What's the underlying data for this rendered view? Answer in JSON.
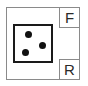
{
  "diagram": {
    "outer_frame": {
      "border_color": "#8a8a8a"
    },
    "labels": [
      {
        "id": "front",
        "text": "F",
        "position": "top-right"
      },
      {
        "id": "rear",
        "text": "R",
        "position": "bottom-right"
      }
    ],
    "component": {
      "border_color": "#1a1a1a",
      "dot_color": "#111111",
      "dots": [
        {
          "x": 28,
          "y": 34
        },
        {
          "x": 42,
          "y": 45
        },
        {
          "x": 25,
          "y": 52
        }
      ]
    }
  }
}
